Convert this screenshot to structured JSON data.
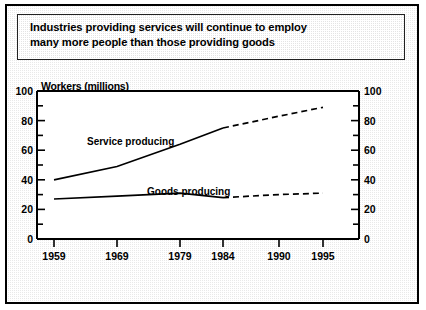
{
  "title": {
    "line1": "Industries providing services will continue to employ",
    "line2": "many more people than those providing goods"
  },
  "chart_data": {
    "type": "line",
    "title": "Industries providing services will continue to employ many more people than those providing goods",
    "axis_title": "Workers (millions)",
    "xlabel": "",
    "ylabel": "Workers (millions)",
    "ylim": [
      0,
      100
    ],
    "yticks": [
      0,
      20,
      40,
      60,
      80,
      100
    ],
    "yticks_right": [
      0,
      20,
      40,
      60,
      80,
      100
    ],
    "xticks": [
      1959,
      1969,
      1979,
      1984,
      1990,
      1995
    ],
    "xlim": [
      1959,
      1995
    ],
    "grid": false,
    "legend": "inline-labels",
    "x": [
      1959,
      1969,
      1979,
      1984,
      1990,
      1995
    ],
    "series": [
      {
        "name": "Service producing",
        "label": "Service producing",
        "values": [
          40,
          49,
          64,
          75,
          83,
          89
        ],
        "projected_from": 1984,
        "style_actual": "solid",
        "style_projected": "dashed"
      },
      {
        "name": "Goods producing",
        "label": "Goods producing",
        "values": [
          27,
          29,
          31,
          28,
          30,
          31
        ],
        "projected_from": 1984,
        "style_actual": "solid",
        "style_projected": "dashed"
      }
    ]
  },
  "colors": {
    "line": "#000000",
    "border": "#000000",
    "plot_background": "#ffffff",
    "page_background": "#e9e9e9"
  }
}
